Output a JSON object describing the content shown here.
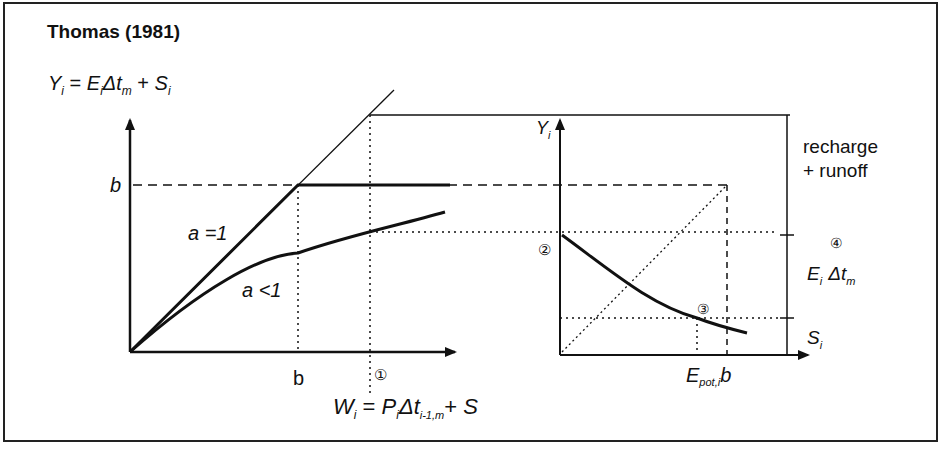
{
  "title": "Thomas (1981)",
  "equations": {
    "y": {
      "lhs": "Y",
      "lhs_sub": "i",
      "eq": " = ",
      "e": "E",
      "e_sub": "i",
      "delta": "Δt",
      "delta_sub": "m",
      "plus": " + ",
      "s": "S",
      "s_sub": "i"
    },
    "w": {
      "lhs": "W",
      "lhs_sub": "i",
      "eq": " = ",
      "p": "P",
      "p_sub": "i",
      "delta": "Δt",
      "delta_sub": "i-1,m",
      "plus": "+ ",
      "s": "S"
    }
  },
  "left_chart": {
    "y_tick_label": "b",
    "x_tick_label": "b",
    "curve_labels": [
      "a =1",
      "a <1"
    ],
    "marker": "①"
  },
  "right_chart": {
    "y_axis_label": "Y",
    "y_axis_sub": "i",
    "marker_2": "②",
    "marker_3": "③",
    "marker_4": "④",
    "x_tick_epot": "E",
    "x_tick_epot_sub": "pot,i",
    "x_tick_b": "b",
    "side_label_line1": "recharge",
    "side_label_line2": "+ runoff",
    "side_e": "E",
    "side_e_sub": "i",
    "side_delta": "Δt",
    "side_delta_sub": "m",
    "side_s": "S",
    "side_s_sub": "i"
  },
  "colors": {
    "ink": "#111111",
    "background": "#ffffff"
  }
}
